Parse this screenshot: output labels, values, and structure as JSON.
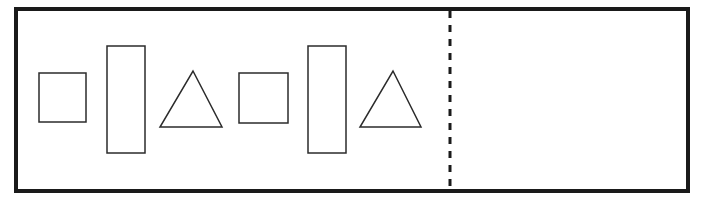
{
  "canvas": {
    "width": 705,
    "height": 212,
    "background_color": "#ffffff"
  },
  "panel": {
    "name": "shape-sorting-panel",
    "x": 14,
    "y": 7,
    "width": 676,
    "height": 186,
    "border_color": "#1a1a1a",
    "border_width": 4,
    "fill_color": "#ffffff"
  },
  "divider": {
    "label": "dashed-divider",
    "orientation": "vertical",
    "x": 450,
    "y_top": 11,
    "y_bottom": 189,
    "color": "#1a1a1a",
    "stroke_width": 3,
    "dash_length": 7,
    "gap_length": 7
  },
  "regions": [
    {
      "name": "left-region",
      "label": "filled-region",
      "x": 18,
      "y": 11,
      "width": 432,
      "height": 178,
      "shape_count": 6
    },
    {
      "name": "right-region",
      "label": "empty-region",
      "x": 450,
      "y": 11,
      "width": 236,
      "height": 178,
      "shape_count": 0
    }
  ],
  "shapes": [
    {
      "id": "shape-1",
      "type": "square",
      "name": "square-small-1",
      "x": 39,
      "y": 73,
      "width": 47,
      "height": 49,
      "stroke_color": "#2b2b2b",
      "stroke_width": 1.5,
      "fill": "none"
    },
    {
      "id": "shape-2",
      "type": "rectangle",
      "name": "rectangle-tall-1",
      "x": 107,
      "y": 46,
      "width": 38,
      "height": 107,
      "stroke_color": "#2b2b2b",
      "stroke_width": 1.5,
      "fill": "none"
    },
    {
      "id": "shape-3",
      "type": "triangle",
      "name": "triangle-1",
      "apex_x": 193,
      "apex_y": 71,
      "base_y": 127,
      "base_left_x": 160,
      "base_right_x": 222,
      "stroke_color": "#2b2b2b",
      "stroke_width": 1.5,
      "fill": "none"
    },
    {
      "id": "shape-4",
      "type": "square",
      "name": "square-small-2",
      "x": 239,
      "y": 73,
      "width": 49,
      "height": 50,
      "stroke_color": "#2b2b2b",
      "stroke_width": 1.5,
      "fill": "none"
    },
    {
      "id": "shape-5",
      "type": "rectangle",
      "name": "rectangle-tall-2",
      "x": 308,
      "y": 46,
      "width": 38,
      "height": 107,
      "stroke_color": "#2b2b2b",
      "stroke_width": 1.5,
      "fill": "none"
    },
    {
      "id": "shape-6",
      "type": "triangle",
      "name": "triangle-2",
      "apex_x": 393,
      "apex_y": 71,
      "base_y": 127,
      "base_left_x": 360,
      "base_right_x": 421,
      "stroke_color": "#2b2b2b",
      "stroke_width": 1.5,
      "fill": "none"
    }
  ]
}
